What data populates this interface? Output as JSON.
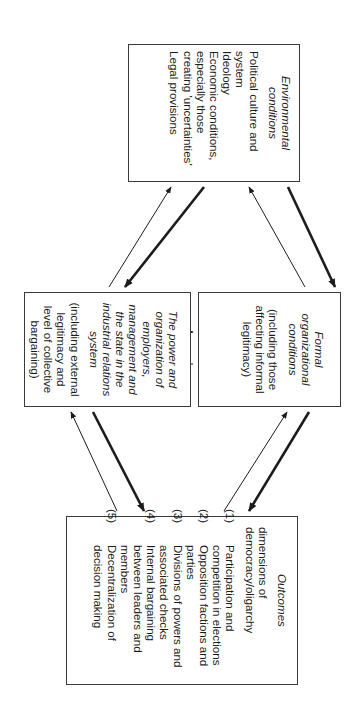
{
  "diagram": {
    "orientation": "rotated 90 degrees clockwise",
    "boxes": {
      "environmental": {
        "title": "Environmental conditions",
        "items": [
          "Political culture and system",
          "Ideology",
          "Economic conditions, especially those creating 'uncertainties'",
          "Legal provisions"
        ]
      },
      "formal": {
        "title": "Formal organizational conditions",
        "subtitle": "(including those affecting informal legitimacy)"
      },
      "power": {
        "title": "The power and organization of employers, management and the state in the industrial relations system",
        "subtitle": "(including external legitimacy and level of collective bargaining)"
      },
      "outcomes": {
        "title": "Outcomes",
        "intro": "dimensions of democracy/oligarchy",
        "items": [
          {
            "num": "(1)",
            "text": "Participation and competition in elections"
          },
          {
            "num": "(2)",
            "text": "Opposition factions and parties"
          },
          {
            "num": "(3)",
            "text": "Divisions of powers and associated checks"
          },
          {
            "num": "(4)",
            "text": "Internal bargaining between leaders and members"
          },
          {
            "num": "(5)",
            "text": "Decentralization of decision making"
          }
        ]
      }
    },
    "arrows": [
      {
        "from": "environmental",
        "to": "formal",
        "weight": "thick"
      },
      {
        "from": "formal",
        "to": "environmental",
        "weight": "thin"
      },
      {
        "from": "environmental",
        "to": "power",
        "weight": "thick"
      },
      {
        "from": "power",
        "to": "environmental",
        "weight": "thin"
      },
      {
        "from": "formal",
        "to": "power",
        "weight": "thin"
      },
      {
        "from": "power",
        "to": "formal",
        "weight": "thin"
      },
      {
        "from": "formal",
        "to": "outcomes",
        "weight": "thick"
      },
      {
        "from": "outcomes",
        "to": "formal",
        "weight": "thin"
      },
      {
        "from": "power",
        "to": "outcomes",
        "weight": "thick"
      },
      {
        "from": "outcomes",
        "to": "power",
        "weight": "thin"
      }
    ],
    "colors": {
      "line": "#1c1c1c",
      "border": "#3a3a3a",
      "background": "#ffffff"
    }
  }
}
